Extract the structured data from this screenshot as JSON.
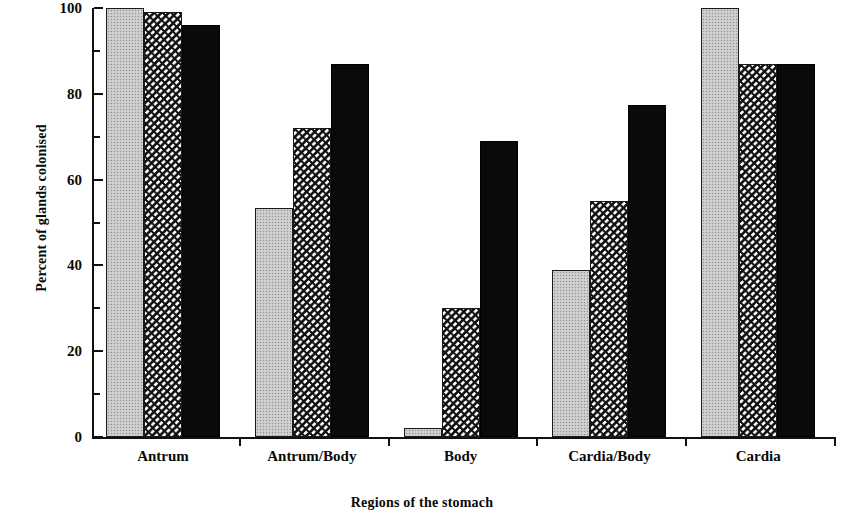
{
  "chart_data": {
    "type": "bar",
    "title": "",
    "subtitle": "",
    "xlabel": "Regions of the stomach",
    "ylabel": "Percent of glands colonised",
    "categories": [
      "Antrum",
      "Antrum/Body",
      "Body",
      "Cardia/Body",
      "Cardia"
    ],
    "series": [
      {
        "name": "series-1-stippled-grey",
        "fill": "stippled-grey",
        "color": "#c9c9c9",
        "values": [
          100,
          53.5,
          2,
          39,
          100
        ]
      },
      {
        "name": "series-2-hatched",
        "fill": "diagonal-hatch",
        "color": "#ffffff",
        "values": [
          99,
          72,
          30,
          55,
          87
        ]
      },
      {
        "name": "series-3-solid-black",
        "fill": "solid-black",
        "color": "#0a0a0a",
        "values": [
          96,
          87,
          69,
          77.5,
          87
        ]
      }
    ],
    "ylim": [
      0,
      100
    ],
    "ytick_values": [
      0,
      20,
      40,
      60,
      80,
      100
    ],
    "ytick_labels": [
      "0",
      "20",
      "40",
      "60",
      "80",
      "100"
    ],
    "yminor_tick_values": [
      10,
      30,
      50,
      70,
      90
    ],
    "grid": false,
    "legend": false,
    "legend_position": "none",
    "axis_color": "#111111",
    "background": "#ffffff"
  },
  "axes": {
    "y_title": "Percent of glands colonised",
    "x_title": "Regions of the stomach"
  }
}
